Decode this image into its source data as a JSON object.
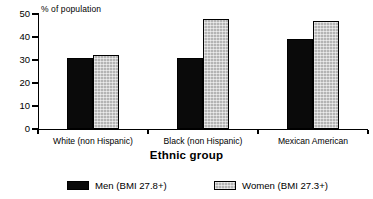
{
  "chart_data": {
    "type": "bar",
    "title": "",
    "xlabel": "Ethnic group",
    "ylabel": "% of population",
    "ylim": [
      0,
      50
    ],
    "yticks": [
      0,
      10,
      20,
      30,
      40,
      50
    ],
    "grid": false,
    "legend_position": "bottom",
    "categories": [
      "White (non Hispanic)",
      "Black (non Hispanic)",
      "Mexican American"
    ],
    "series": [
      {
        "name": "Men (BMI 27.8+)",
        "color": "#0a0a0a",
        "fill": "solid-black",
        "values": [
          31,
          31,
          39
        ]
      },
      {
        "name": "Women (BMI 27.3+)",
        "color": "#b4b4b4",
        "fill": "dotted-gray",
        "values": [
          32,
          48,
          47
        ]
      }
    ]
  },
  "legend": {
    "items": [
      {
        "label": "Men (BMI 27.8+)"
      },
      {
        "label": "Women (BMI 27.3+)"
      }
    ]
  }
}
